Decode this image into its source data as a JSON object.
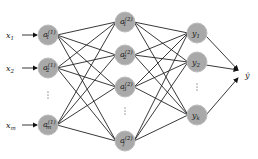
{
  "diagram": {
    "type": "neural-network",
    "inputs": [
      {
        "label": "x",
        "sub": "1",
        "y": 35
      },
      {
        "label": "x",
        "sub": "2",
        "y": 68
      },
      {
        "label": "x",
        "sub": "m",
        "y": 125
      }
    ],
    "layer1": [
      {
        "label": "a",
        "sup": "(1)",
        "sub": "1",
        "y": 35
      },
      {
        "label": "a",
        "sup": "(1)",
        "sub": "2",
        "y": 68
      },
      {
        "label": "a",
        "sup": "(1)",
        "sub": "m",
        "y": 125
      }
    ],
    "layer2": [
      {
        "label": "a",
        "sup": "(2)",
        "sub": "1",
        "y": 22
      },
      {
        "label": "a",
        "sup": "(2)",
        "sub": "2",
        "y": 55
      },
      {
        "label": "a",
        "sup": "(2)",
        "sub": "3",
        "y": 87
      },
      {
        "label": "a",
        "sup": "(2)",
        "sub": "j",
        "y": 141
      }
    ],
    "outputs": [
      {
        "label": "y",
        "sub": "1",
        "y": 33
      },
      {
        "label": "y",
        "sub": "2",
        "y": 62
      },
      {
        "label": "y",
        "sub": "k",
        "y": 115
      }
    ],
    "final_output": {
      "label": "ŷ"
    },
    "ellipsis": "⋮",
    "colors": {
      "node_fill": "#a9a9a9",
      "edge": "#222222",
      "background": "#ffffff"
    }
  }
}
